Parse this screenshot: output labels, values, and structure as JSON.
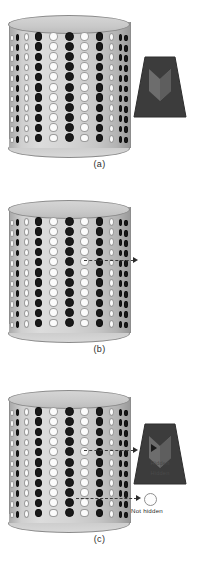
{
  "figure": {
    "panels": [
      {
        "id": "a",
        "caption": "(a)",
        "has_callouts": false,
        "object_label": "",
        "callout_label": ""
      },
      {
        "id": "b",
        "caption": "(b)",
        "has_callouts": true,
        "object_label": "Hidden",
        "callout_label": ""
      },
      {
        "id": "c",
        "caption": "(c)",
        "has_callouts": true,
        "object_label": "Hidden",
        "callout_label": "Not hidden"
      }
    ]
  },
  "colors": {
    "dot_black": "#191919",
    "dot_white": "#fbfbfb",
    "cylinder_light": "#dcdcdc",
    "cylinder_dark": "#9a9a9a",
    "object_dark": "#3a3a3a",
    "object_chevron": "#6a6a6a",
    "leader_line": "#3a3a3a",
    "caption_text": "#2b2b2b"
  },
  "grid": {
    "rows": 11,
    "cols": 11,
    "legend": {
      "b": "black-dot",
      "w": "white-dot"
    },
    "pattern": [
      "wbwbwbwbwbb",
      "wbwbwbwbwbb",
      "wbwbwbwbwbb",
      "wbwbwbwbwbb",
      "wbwbwbwbwbb",
      "wbwbwbwbwbb",
      "wbwbwbwbwbb",
      "wbwbwbwbwbb",
      "wbwbwbwbwbb",
      "wbwbwbwbwbb",
      "wbwbwbwbwbb"
    ]
  },
  "annotations": {
    "hidden_row_index": 5,
    "hidden_col_index": 8,
    "not_hidden_row_index": 9,
    "not_hidden_col_index": 7
  }
}
